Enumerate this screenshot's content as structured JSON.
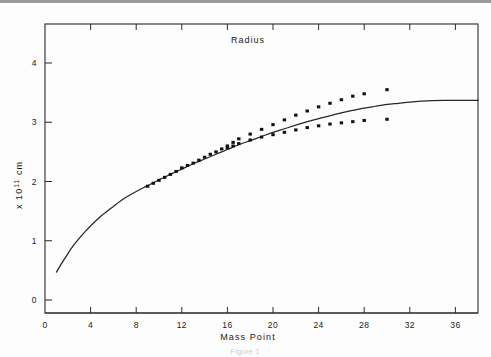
{
  "figure": {
    "title": "Radius",
    "caption": "Figure 1"
  },
  "chart_data": {
    "type": "line",
    "title": "Radius",
    "xlabel": "Mass Point",
    "ylabel": "x 10¹¹ cm",
    "ylabel_parts": {
      "prefix": "x 10",
      "exponent": "11",
      "unit": " cm"
    },
    "xlim": [
      0,
      38
    ],
    "ylim": [
      -0.1,
      4.6
    ],
    "xticks": [
      0,
      4,
      8,
      12,
      16,
      20,
      24,
      28,
      32,
      36
    ],
    "xticklabels": [
      "0",
      "4",
      "8",
      "12",
      "16",
      "20",
      "24",
      "28",
      "32",
      "36"
    ],
    "yticks": [
      0,
      1,
      2,
      3,
      4
    ],
    "yticklabels": [
      "0",
      "1",
      "2",
      "3",
      "4"
    ],
    "grid": false,
    "legend": false,
    "top_axis_ticks": true,
    "series": [
      {
        "name": "model curve",
        "style": "solid-line",
        "x": [
          1.0,
          1.5,
          2.0,
          2.5,
          3.0,
          3.5,
          4.0,
          5.0,
          6.0,
          7.0,
          8.0,
          9.0,
          10.0,
          11.0,
          12.0,
          13.0,
          14.0,
          15.0,
          16.0,
          17.0,
          18.0,
          19.0,
          20.0,
          21.0,
          22.0,
          23.0,
          24.0,
          25.0,
          26.0,
          27.0,
          28.0,
          29.0,
          30.0,
          31.0,
          32.0,
          33.0,
          34.0,
          35.0,
          36.0,
          37.0,
          38.0
        ],
        "y": [
          0.47,
          0.63,
          0.78,
          0.92,
          1.04,
          1.15,
          1.25,
          1.43,
          1.58,
          1.72,
          1.83,
          1.93,
          2.03,
          2.12,
          2.21,
          2.3,
          2.38,
          2.46,
          2.54,
          2.62,
          2.69,
          2.76,
          2.83,
          2.89,
          2.95,
          3.01,
          3.06,
          3.11,
          3.16,
          3.2,
          3.24,
          3.27,
          3.3,
          3.32,
          3.34,
          3.355,
          3.365,
          3.37,
          3.37,
          3.37,
          3.37
        ]
      },
      {
        "name": "upper branch",
        "style": "square-dots",
        "x": [
          9.0,
          9.5,
          10.0,
          10.5,
          11.0,
          11.5,
          12.0,
          12.5,
          13.0,
          13.5,
          14.0,
          14.5,
          15.0,
          15.5,
          16.0,
          16.5,
          17.0,
          18.0,
          19.0,
          20.0,
          21.0,
          22.0,
          23.0,
          24.0,
          25.0,
          26.0,
          27.0,
          28.0,
          30.0
        ],
        "y": [
          1.92,
          1.97,
          2.02,
          2.07,
          2.12,
          2.17,
          2.23,
          2.27,
          2.31,
          2.36,
          2.41,
          2.46,
          2.5,
          2.55,
          2.6,
          2.66,
          2.72,
          2.8,
          2.88,
          2.96,
          3.04,
          3.12,
          3.19,
          3.26,
          3.32,
          3.38,
          3.44,
          3.48,
          3.55
        ]
      },
      {
        "name": "lower branch",
        "style": "square-dots",
        "x": [
          16.0,
          16.5,
          17.0,
          18.0,
          19.0,
          20.0,
          21.0,
          22.0,
          23.0,
          24.0,
          25.0,
          26.0,
          27.0,
          28.0,
          30.0
        ],
        "y": [
          2.57,
          2.6,
          2.64,
          2.7,
          2.75,
          2.79,
          2.83,
          2.87,
          2.91,
          2.94,
          2.97,
          2.99,
          3.01,
          3.03,
          3.05
        ]
      }
    ]
  },
  "axes_geometry": {
    "plot_left_px": 45,
    "plot_right_px": 478,
    "plot_top_px": 24,
    "plot_bottom_px": 313,
    "x_origin_px": 45,
    "x_px_per_unit": 11.4,
    "y_zero_px": 300,
    "y_px_per_unit": 59.25
  }
}
